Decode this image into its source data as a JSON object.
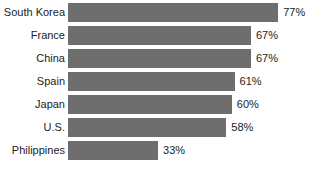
{
  "chart_data": {
    "type": "bar",
    "orientation": "horizontal",
    "title": "",
    "subtitle": "",
    "xlabel": "",
    "ylabel": "",
    "grid": false,
    "legend": false,
    "axis_visible": false,
    "xlim": [
      0,
      100
    ],
    "value_suffix": "%",
    "bar_color": "#6e6e6e",
    "text_color": "#1c1c1c",
    "background_color": "#ffffff",
    "categories": [
      "South Korea",
      "France",
      "China",
      "Spain",
      "Japan",
      "U.S.",
      "Philippines"
    ],
    "values": [
      77,
      67,
      67,
      61,
      60,
      58,
      33
    ],
    "value_labels": [
      "77%",
      "67%",
      "67%",
      "61%",
      "60%",
      "58%",
      "33%"
    ],
    "rows": [
      {
        "category": "South Korea",
        "value": 77,
        "value_label": "77%"
      },
      {
        "category": "France",
        "value": 67,
        "value_label": "67%"
      },
      {
        "category": "China",
        "value": 67,
        "value_label": "67%"
      },
      {
        "category": "Spain",
        "value": 61,
        "value_label": "61%"
      },
      {
        "category": "Japan",
        "value": 60,
        "value_label": "60%"
      },
      {
        "category": "U.S.",
        "value": 58,
        "value_label": "58%"
      },
      {
        "category": "Philippines",
        "value": 33,
        "value_label": "33%"
      }
    ]
  }
}
